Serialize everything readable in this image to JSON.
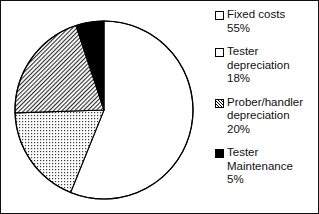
{
  "chart_data": {
    "type": "pie",
    "title": "",
    "categories": [
      "Fixed costs",
      "Tester depreciation",
      "Prober/handler depreciation",
      "Tester Maintenance"
    ],
    "values": [
      55,
      18,
      20,
      5
    ],
    "value_unit": "%",
    "start_angle_deg": 0,
    "direction": "clockwise",
    "legend_position": "right",
    "grid": false,
    "slices": [
      {
        "label": "Fixed costs",
        "value": 55,
        "value_text": "55%",
        "pattern": "empty",
        "fill": "#ffffff",
        "stroke": "#000000"
      },
      {
        "label": "Tester depreciation",
        "value": 18,
        "value_text": "18%",
        "pattern": "dots",
        "fill": "#ffffff",
        "stroke": "#000000"
      },
      {
        "label": "Prober/handler depreciation",
        "value": 20,
        "value_text": "20%",
        "pattern": "diagonal-hatch",
        "fill": "#ffffff",
        "stroke": "#000000"
      },
      {
        "label": "Tester Maintenance",
        "value": 5,
        "value_text": "5%",
        "pattern": "solid",
        "fill": "#000000",
        "stroke": "#000000"
      }
    ]
  },
  "legend": {
    "items": [
      {
        "marker": "empty-square-swatch",
        "line1": "Fixed costs",
        "line2": "55%",
        "line3": ""
      },
      {
        "marker": "dotted-square-swatch",
        "line1": "Tester",
        "line2": "depreciation",
        "line3": "18%"
      },
      {
        "marker": "hatched-square-swatch",
        "line1": "Prober/handler",
        "line2": "depreciation",
        "line3": "20%"
      },
      {
        "marker": "solid-black-square-swatch",
        "line1": "Tester",
        "line2": "Maintenance",
        "line3": "5%"
      }
    ]
  },
  "colors": {
    "ink": "#111111",
    "background": "#ffffff",
    "slice_solid": "#000000"
  }
}
